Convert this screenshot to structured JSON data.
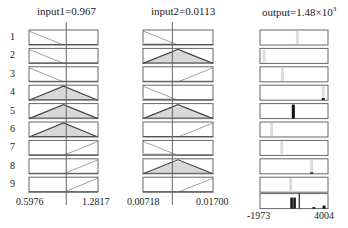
{
  "inputs": [
    {
      "title": "input1=0.967",
      "min_label": "0.5976",
      "max_label": "1.2817",
      "value": 0.967,
      "range": [
        0.5976,
        1.2817
      ],
      "rules": [
        "zmf",
        "zmf",
        "zmf",
        "trimf",
        "trimf",
        "trimf",
        "smf",
        "smf",
        "smf"
      ]
    },
    {
      "title": "input2=0.0113",
      "min_label": "0.00718",
      "max_label": "0.01700",
      "value": 0.0113,
      "range": [
        0.00718,
        0.017
      ],
      "rules": [
        "zmf",
        "trimf",
        "smf",
        "zmf",
        "trimf",
        "smf",
        "zmf",
        "trimf",
        "smf"
      ]
    }
  ],
  "output": {
    "title_main": "output=1.48×10",
    "title_exp": "3",
    "min_label": "-1973",
    "max_label": "4004",
    "value": 1480,
    "range": [
      -1973,
      4004
    ],
    "rule_positions": [
      0.55,
      0.06,
      0.33,
      0.93,
      0.49,
      0.17,
      0.32,
      0.76,
      0.45
    ],
    "rule_firing": [
      0,
      0,
      0,
      0.15,
      1.0,
      0,
      0,
      0.1,
      0
    ]
  },
  "rule_labels": [
    "1",
    "2",
    "3",
    "4",
    "5",
    "6",
    "7",
    "8",
    "9"
  ]
}
